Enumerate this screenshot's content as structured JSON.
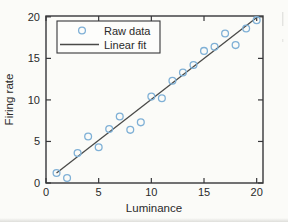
{
  "figure": {
    "background": "#fbfbf8",
    "axis_color": "#37373a",
    "text_color": "#2a2a2a"
  },
  "chart_data": {
    "type": "scatter",
    "title": "",
    "xlabel": "Luminance",
    "ylabel": "Firing rate",
    "xlim": [
      0,
      20.6
    ],
    "ylim": [
      0,
      20.1
    ],
    "x_ticks": [
      0,
      5,
      10,
      15,
      20
    ],
    "y_ticks": [
      0,
      5,
      10,
      15,
      20
    ],
    "grid": false,
    "box": true,
    "legend": {
      "position": "top-left",
      "entries": [
        {
          "label": "Raw data",
          "type": "marker"
        },
        {
          "label": "Linear fit",
          "type": "line"
        }
      ]
    },
    "series": [
      {
        "name": "Raw data",
        "type": "scatter",
        "marker": "circle-open",
        "color": "#7fb0d6",
        "x": [
          1,
          2,
          3,
          4,
          5,
          6,
          7,
          8,
          9,
          10,
          11,
          12,
          13,
          14,
          15,
          16,
          17,
          18,
          19,
          20
        ],
        "y": [
          1.2,
          0.6,
          3.6,
          5.6,
          4.3,
          6.5,
          8.0,
          6.4,
          7.3,
          10.4,
          10.2,
          12.3,
          13.3,
          14.2,
          15.9,
          16.4,
          18.0,
          16.6,
          18.6,
          19.6
        ]
      },
      {
        "name": "Linear fit",
        "type": "line",
        "color": "#4a4a48",
        "x": [
          1,
          20.1
        ],
        "y": [
          1.2,
          20.0
        ]
      }
    ]
  }
}
